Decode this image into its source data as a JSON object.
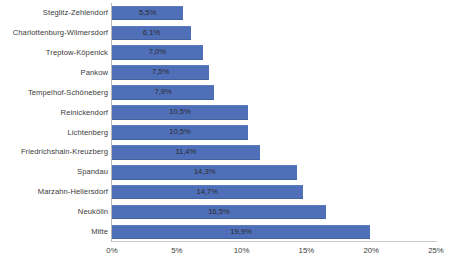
{
  "chart_data": {
    "type": "bar",
    "orientation": "horizontal",
    "title": "",
    "subtitle": "",
    "xlabel": "",
    "ylabel": "",
    "xlim": [
      0,
      25
    ],
    "x_tick_labels": [
      "0%",
      "5%",
      "10%",
      "15%",
      "20%",
      "25%"
    ],
    "x_tick_values": [
      0,
      5,
      10,
      15,
      20,
      25
    ],
    "grid": false,
    "legend": false,
    "bar_color": "#4f6fb8",
    "categories": [
      "Steglitz-Zehlendorf",
      "Charlottenburg-Wilmersdorf",
      "Treptow-Köpenick",
      "Pankow",
      "Tempelhof-Schöneberg",
      "Reinickendorf",
      "Lichtenberg",
      "Friedrichshain-Kreuzberg",
      "Spandau",
      "Marzahn-Hellersdorf",
      "Neukölln",
      "Mitte"
    ],
    "values": [
      5.5,
      6.1,
      7.0,
      7.5,
      7.9,
      10.5,
      10.5,
      11.4,
      14.3,
      14.7,
      16.5,
      19.9
    ],
    "value_labels": [
      "5,5%",
      "6,1%",
      "7,0%",
      "7,5%",
      "7,9%",
      "10,5%",
      "10,5%",
      "11,4%",
      "14,3%",
      "14,7%",
      "16,5%",
      "19,9%"
    ]
  }
}
